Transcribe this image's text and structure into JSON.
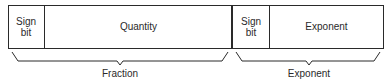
{
  "diagram": {
    "cells": [
      {
        "id": "fraction-sign-bit",
        "label_line1": "Sign",
        "label_line2": "bit"
      },
      {
        "id": "quantity",
        "label": "Quantity"
      },
      {
        "id": "exponent-sign-bit",
        "label_line1": "Sign",
        "label_line2": "bit"
      },
      {
        "id": "exponent",
        "label": "Exponent"
      }
    ],
    "groups": [
      {
        "id": "fraction-group",
        "label": "Fraction"
      },
      {
        "id": "exponent-group",
        "label": "Exponent"
      }
    ]
  }
}
